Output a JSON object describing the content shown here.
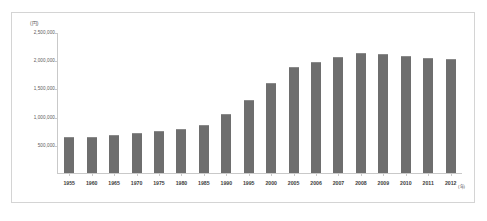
{
  "chart_data": {
    "type": "bar",
    "title": "",
    "xlabel": "",
    "ylabel": "",
    "x_unit": "(年)",
    "y_unit": "(円)",
    "ylim": [
      0,
      2500000
    ],
    "y_ticks": [
      "500,000",
      "1,000,000",
      "1,500,000",
      "2,000,000",
      "2,500,000"
    ],
    "y_tick_values": [
      500000,
      1000000,
      1500000,
      2000000,
      2500000
    ],
    "grid": false,
    "legend": "none",
    "bar_color": "#6e6e6e",
    "categories": [
      "1955",
      "1960",
      "1965",
      "1970",
      "1975",
      "1980",
      "1985",
      "1990",
      "1995",
      "2000",
      "2005",
      "2006",
      "2007",
      "2008",
      "2009",
      "2010",
      "2011",
      "2012"
    ],
    "values": [
      640000,
      650000,
      670000,
      710000,
      755000,
      780000,
      860000,
      1060000,
      1300000,
      1600000,
      1900000,
      1985000,
      2075000,
      2150000,
      2120000,
      2090000,
      2050000,
      2040000
    ]
  }
}
